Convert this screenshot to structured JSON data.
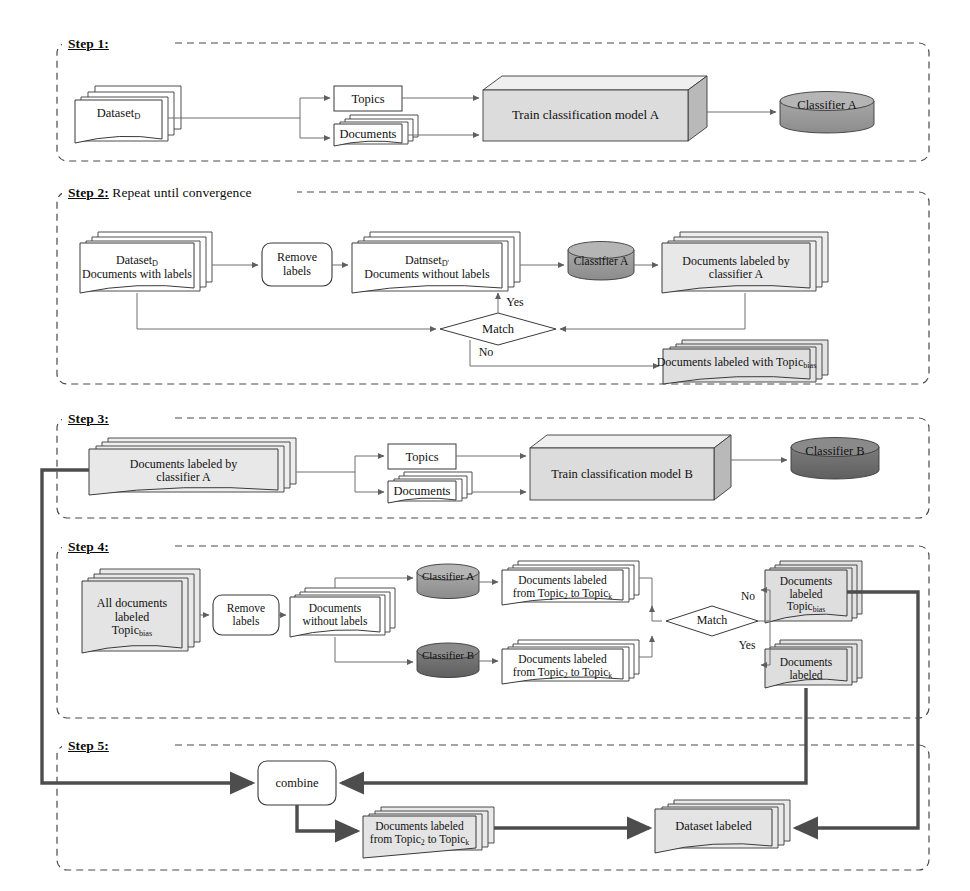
{
  "diagram": {
    "colors": {
      "page_bg": "#ffffff",
      "stroke": "#2b2b2b",
      "dashed_border": "#4a4a4a",
      "doc_white_fill": "#ffffff",
      "doc_gray_fill": "#e3e3e3",
      "box3d_front": "#dcdcdc",
      "box3d_top": "#efefef",
      "box3d_side": "#b9b9b9",
      "cylinder_a": "#9a9a9a",
      "cylinder_a_top": "#b5b5b5",
      "cylinder_b": "#6f6f6f",
      "cylinder_b_top": "#8a8a8a",
      "thick_line": "#4d4d4d",
      "thin_line": "#6e6e6e"
    }
  },
  "steps": [
    {
      "id": "step1",
      "label": "Step 1:",
      "caption": ""
    },
    {
      "id": "step2",
      "label": "Step 2:",
      "caption": " Repeat until convergence"
    },
    {
      "id": "step3",
      "label": "Step 3:",
      "caption": ""
    },
    {
      "id": "step4",
      "label": "Step 4:",
      "caption": ""
    },
    {
      "id": "step5",
      "label": "Step 5:",
      "caption": ""
    }
  ],
  "step1": {
    "dataset": "Dataset",
    "dataset_sub": "D",
    "topics": "Topics",
    "documents": "Documents",
    "train_model": "Train classification model A",
    "classifier": "Classifier A"
  },
  "step2": {
    "dataset_line1": "Dataset",
    "dataset_line1_sub": "D",
    "dataset_line2": "Documents  with labels",
    "remove_labels_line1": "Remove",
    "remove_labels_line2": "labels",
    "dataset_prime_line1": "Datnset",
    "dataset_prime_sub": "D'",
    "dataset_prime_line2": "Documents without labels",
    "classifier": "Classifier A",
    "docs_labeled_line1": "Documents  labeled by",
    "docs_labeled_line2": "classifier A",
    "match": "Match",
    "yes": "Yes",
    "no": "No",
    "docs_topic_bias": "Documents  labeled with Topic",
    "docs_topic_bias_sub": "bias"
  },
  "step3": {
    "docs_line1": "Documents  labeled by",
    "docs_line2": "classifier A",
    "topics": "Topics",
    "documents": "Documents",
    "train_model": "Train classification model B",
    "classifier": "Classifier B"
  },
  "step4": {
    "all_docs_line1": "All documents",
    "all_docs_line2": "labeled",
    "all_docs_line3": "Topic",
    "all_docs_sub": "bias",
    "remove_labels_line1": "Remove",
    "remove_labels_line2": "labels",
    "docs_no_labels_line1": "Documents",
    "docs_no_labels_line2": "without  labels",
    "classifier_a": "Classifier A",
    "classifier_b": "Classifier B",
    "docs_a_line1": "Documents  labeled",
    "docs_a_line2_pre": "from Topic",
    "docs_a_line2_sub1": "2",
    "docs_a_line2_mid": " to Topic",
    "docs_a_line2_sub2": "k",
    "docs_b_line1": "Documents  labeled",
    "docs_b_line2_pre": "from Topic",
    "docs_b_line2_sub1": "2",
    "docs_b_line2_mid": " to Topic",
    "docs_b_line2_sub2": "k",
    "match": "Match",
    "no": "No",
    "yes": "Yes",
    "out_no_line1": "Documents",
    "out_no_line2": "labeled",
    "out_no_line3": "Topic",
    "out_no_sub": "bias",
    "out_yes_line1": "Documents",
    "out_yes_line2": "labeled"
  },
  "step5": {
    "combine": "combine",
    "docs_line1": "Documents  labeled",
    "docs_line2_pre": "from Topic",
    "docs_line2_sub1": "2",
    "docs_line2_mid": " to Topic",
    "docs_line2_sub2": "k",
    "dataset_labeled": "Dataset labeled"
  }
}
